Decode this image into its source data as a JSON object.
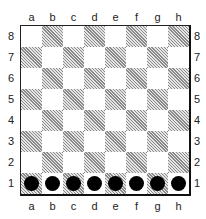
{
  "board": {
    "files": [
      "a",
      "b",
      "c",
      "d",
      "e",
      "f",
      "g",
      "h"
    ],
    "ranks": [
      "8",
      "7",
      "6",
      "5",
      "4",
      "3",
      "2",
      "1"
    ],
    "light_square_color": "#ffffff",
    "dark_square_style": "hatched-gray",
    "pieces": [
      {
        "square": "a1",
        "type": "black-disc",
        "color": "#000000"
      },
      {
        "square": "b1",
        "type": "black-disc",
        "color": "#000000"
      },
      {
        "square": "c1",
        "type": "black-disc",
        "color": "#000000"
      },
      {
        "square": "d1",
        "type": "black-disc",
        "color": "#000000"
      },
      {
        "square": "e1",
        "type": "black-disc",
        "color": "#000000"
      },
      {
        "square": "f1",
        "type": "black-disc",
        "color": "#000000"
      },
      {
        "square": "g1",
        "type": "black-disc",
        "color": "#000000"
      },
      {
        "square": "h1",
        "type": "black-disc",
        "color": "#000000"
      }
    ]
  }
}
